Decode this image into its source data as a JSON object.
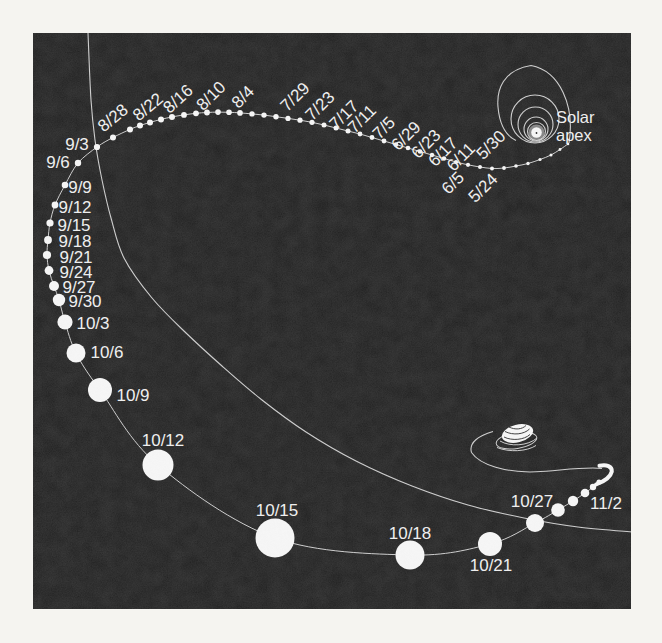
{
  "canvas": {
    "width": 662,
    "height": 643,
    "margin_color": "#f5f4f0"
  },
  "panel": {
    "x": 33,
    "y": 33,
    "width": 598,
    "height": 576,
    "fill": "#1b1b1b"
  },
  "style": {
    "line_color": "#c9c9c9",
    "dot_color": "#f4f4f4",
    "label_color": "#ededed",
    "label_font_size": 17,
    "apex_font_size": 16.5
  },
  "solar_apex": {
    "label": [
      "Solar",
      "apex"
    ],
    "label_x": 556,
    "label_baseline1": 123,
    "label_baseline2": 141,
    "outer_loop": "M 569,143 C 575,106 560,71 531,65.5 C 503,70 496.5,90 498,107 C 499.5,124 505.5,135.5 516,140.5",
    "rings": [
      {
        "cx": 535,
        "cy": 119,
        "r": 24
      },
      {
        "cx": 535.5,
        "cy": 124.5,
        "r": 17.5
      },
      {
        "cx": 536,
        "cy": 129,
        "r": 12
      },
      {
        "cx": 536.5,
        "cy": 131.5,
        "r": 9
      }
    ],
    "core": {
      "cx": 536.5,
      "cy": 132.5,
      "glow_r": 8,
      "r": 5.3,
      "speck_r": 0.9
    }
  },
  "orbit_curve": {
    "points": [
      [
        88,
        33
      ],
      [
        91,
        100
      ],
      [
        95,
        140
      ],
      [
        102,
        180
      ],
      [
        111,
        218
      ],
      [
        124,
        258
      ],
      [
        152,
        298
      ],
      [
        185,
        332
      ],
      [
        222,
        366
      ],
      [
        262,
        400
      ],
      [
        306,
        432
      ],
      [
        356,
        461
      ],
      [
        412,
        486
      ],
      [
        468,
        505
      ],
      [
        524,
        518
      ],
      [
        578,
        527
      ],
      [
        633,
        532
      ]
    ]
  },
  "trajectory": {
    "dots": [
      [
        568,
        144,
        1.3
      ],
      [
        560,
        149.5,
        1.4
      ],
      [
        551,
        155,
        1.5
      ],
      [
        540,
        159.5,
        1.6
      ],
      [
        528,
        163.5,
        1.7
      ],
      [
        516,
        166,
        1.8
      ],
      [
        504,
        168,
        1.9
      ],
      [
        492,
        168.5,
        2
      ],
      [
        480,
        167,
        2
      ],
      [
        468,
        164.8,
        2.1
      ],
      [
        456,
        162,
        2.1
      ],
      [
        444,
        158.5,
        2.2
      ],
      [
        432,
        155,
        2.2
      ],
      [
        420,
        151.5,
        2.3
      ],
      [
        408,
        148,
        2.3
      ],
      [
        396,
        144.5,
        2.3
      ],
      [
        384,
        141,
        2.4
      ],
      [
        372,
        137.5,
        2.4
      ],
      [
        360,
        134,
        2.4
      ],
      [
        348,
        131,
        2.5
      ],
      [
        336,
        128,
        2.5
      ],
      [
        324,
        125,
        2.5
      ],
      [
        312,
        122.3,
        2.6
      ],
      [
        300,
        120.2,
        2.6
      ],
      [
        288,
        118.4,
        2.6
      ],
      [
        276,
        116.7,
        2.7
      ],
      [
        264,
        115.1,
        2.7
      ],
      [
        252,
        113.9,
        2.7
      ],
      [
        240,
        112.9,
        2.8
      ],
      [
        229,
        112.3,
        2.8
      ],
      [
        218,
        112.1,
        2.8
      ],
      [
        207,
        112.5,
        2.9
      ],
      [
        196,
        113.3,
        2.9
      ],
      [
        184,
        114.9,
        2.9
      ],
      [
        172,
        116.9,
        3
      ],
      [
        161,
        119.4,
        3
      ],
      [
        150,
        122.4,
        3
      ],
      [
        140,
        125.6,
        3
      ],
      [
        130,
        129.4,
        3
      ],
      [
        113,
        137.5,
        3
      ],
      [
        97,
        147,
        3.1
      ],
      [
        78,
        163,
        3.2
      ],
      [
        65,
        185,
        3.3
      ],
      [
        55,
        205,
        3.4
      ],
      [
        50,
        223,
        3.6
      ],
      [
        48,
        240,
        3.9
      ],
      [
        47,
        255,
        4.1
      ],
      [
        49,
        270.5,
        4.4
      ],
      [
        54,
        286,
        5
      ],
      [
        59,
        300,
        6.2
      ],
      [
        65,
        322,
        7.6
      ],
      [
        76,
        353,
        9.5
      ],
      [
        100,
        390,
        12
      ],
      [
        158,
        465,
        15.5
      ],
      [
        275,
        538,
        19.5
      ],
      [
        410,
        555,
        14.5
      ],
      [
        490,
        544,
        12
      ],
      [
        535,
        523,
        9
      ],
      [
        558,
        510,
        6.8
      ],
      [
        573,
        501,
        5.2
      ],
      [
        585,
        493,
        4.3
      ],
      [
        593,
        487,
        3.2
      ],
      [
        599,
        482,
        2.6
      ]
    ],
    "hook": "M 596,484.5 C 604,481.5 610.5,477.5 611.8,471.5 C 612.3,466.5 606.5,464 599.5,465.8"
  },
  "anti_apex": {
    "return_curve": "M 602,468.5 C 586,466.5 560,470.5 536,471.8 C 506,473 480,465 471.5,452.5 C 468.5,442.5 479,435.5 493,431.5",
    "loop_ring": {
      "cx": 516.5,
      "cy": 440.5,
      "rx": 20.5,
      "ry": 8,
      "rot": -9
    },
    "under_arc": "M 497,447.5 C 509,452.5 527,451.5 536,445.5",
    "outer_arc": "M 500,441 C 510,447 528,446 537,438",
    "coil_blob": {
      "cx": 517.5,
      "cy": 433.5,
      "rx": 16,
      "ry": 8.8,
      "rot": -14
    },
    "coil_scribbles": [
      "M 504,437 C 512,441 524,440 530,434.5",
      "M 505,431.5 C 513,435.5 524,434.5 529.5,429",
      "M 509,427 C 515,430 522,429.5 526,425.5"
    ]
  },
  "date_labels": [
    {
      "text": "8/28",
      "x": 113,
      "y": 118,
      "rot": -40
    },
    {
      "text": "8/22",
      "x": 148,
      "y": 107,
      "rot": -40
    },
    {
      "text": "8/16",
      "x": 178,
      "y": 99,
      "rot": -42
    },
    {
      "text": "8/10",
      "x": 211,
      "y": 96,
      "rot": -45
    },
    {
      "text": "8/4",
      "x": 243,
      "y": 97,
      "rot": -45
    },
    {
      "text": "7/29",
      "x": 295,
      "y": 97,
      "rot": -45
    },
    {
      "text": "7/23",
      "x": 320,
      "y": 106,
      "rot": -45
    },
    {
      "text": "7/17",
      "x": 344,
      "y": 115,
      "rot": -45
    },
    {
      "text": "7/11",
      "x": 362,
      "y": 119,
      "rot": -45
    },
    {
      "text": "7/5",
      "x": 384,
      "y": 128,
      "rot": -45
    },
    {
      "text": "6/29",
      "x": 406,
      "y": 136,
      "rot": -45
    },
    {
      "text": "6/23",
      "x": 426,
      "y": 144,
      "rot": -45
    },
    {
      "text": "6/17",
      "x": 443,
      "y": 152,
      "rot": -45
    },
    {
      "text": "6/11",
      "x": 461,
      "y": 157,
      "rot": -45
    },
    {
      "text": "6/5",
      "x": 453,
      "y": 183,
      "rot": -45
    },
    {
      "text": "5/30",
      "x": 491,
      "y": 145,
      "rot": -45
    },
    {
      "text": "5/24",
      "x": 483,
      "y": 188,
      "rot": -45
    },
    {
      "text": "9/3",
      "x": 77,
      "y": 144,
      "rot": 0
    },
    {
      "text": "9/6",
      "x": 58,
      "y": 162,
      "rot": 0
    },
    {
      "text": "9/9",
      "x": 80,
      "y": 187,
      "rot": 0
    },
    {
      "text": "9/12",
      "x": 75,
      "y": 207,
      "rot": 0
    },
    {
      "text": "9/15",
      "x": 74,
      "y": 225,
      "rot": 0
    },
    {
      "text": "9/18",
      "x": 75,
      "y": 241,
      "rot": 0
    },
    {
      "text": "9/21",
      "x": 76,
      "y": 257,
      "rot": 0
    },
    {
      "text": "9/24",
      "x": 76,
      "y": 272,
      "rot": 0
    },
    {
      "text": "9/27",
      "x": 79,
      "y": 287,
      "rot": 0
    },
    {
      "text": "9/30",
      "x": 85,
      "y": 301,
      "rot": 0
    },
    {
      "text": "10/3",
      "x": 93,
      "y": 323,
      "rot": 0
    },
    {
      "text": "10/6",
      "x": 107,
      "y": 352,
      "rot": 0
    },
    {
      "text": "10/9",
      "x": 133,
      "y": 395,
      "rot": 0
    },
    {
      "text": "10/12",
      "x": 163,
      "y": 440,
      "rot": 0
    },
    {
      "text": "10/15",
      "x": 277,
      "y": 510,
      "rot": 0
    },
    {
      "text": "10/18",
      "x": 410,
      "y": 533,
      "rot": 0
    },
    {
      "text": "10/21",
      "x": 491,
      "y": 565,
      "rot": 0
    },
    {
      "text": "10/27",
      "x": 532,
      "y": 501,
      "rot": 0
    },
    {
      "text": "11/2",
      "x": 606,
      "y": 503,
      "rot": 0
    }
  ]
}
